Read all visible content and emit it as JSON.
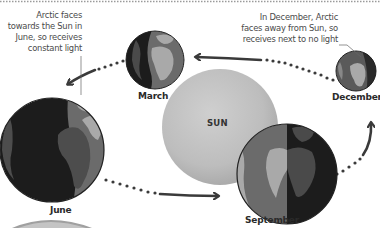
{
  "diagram": {
    "sun": {
      "label": "SUN",
      "color": "#b9b9b9"
    },
    "globes": [
      {
        "id": "june",
        "label": "June"
      },
      {
        "id": "march",
        "label": "March"
      },
      {
        "id": "september",
        "label": "September"
      },
      {
        "id": "december",
        "label": "December"
      }
    ],
    "annotations": {
      "june": {
        "lines": [
          "Arctic faces",
          "towards the Sun in",
          "June, so receives",
          "constant light"
        ]
      },
      "december": {
        "lines": [
          "In December, Arctic",
          "faces away from Sun, so",
          "receives next to no light"
        ]
      }
    },
    "colors": {
      "ocean_lit": "#6b6b6b",
      "ocean_dark": "#1e1e1e",
      "land_lit": "#a9a9a9",
      "land_dark": "#4a4a4a",
      "arrow": "#3a3a3a",
      "text": "#2a2a2a"
    },
    "orbit_order": [
      "June",
      "September",
      "December",
      "March"
    ]
  }
}
